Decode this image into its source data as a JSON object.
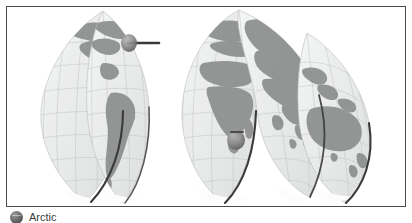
{
  "frame": {
    "border_color": "#4a4a4a",
    "background": "#ffffff"
  },
  "map": {
    "title": "Interrupted world map",
    "projection": "Goode homolosine interrupted globe gores",
    "style": "grayscale shaded relief with graticule",
    "land_color": "#8f9191",
    "ocean_color": "#e9eaea",
    "graticule_color": "#b9bcbc",
    "shadow_color": "#3a3a3a",
    "gores": [
      {
        "id": "gore-americas-north",
        "label": "North America lobe"
      },
      {
        "id": "gore-americas-south",
        "label": "South America lobe"
      },
      {
        "id": "gore-africa-europe",
        "label": "Europe and Africa lobe"
      },
      {
        "id": "gore-asia",
        "label": "Asia lobe"
      },
      {
        "id": "gore-oceania",
        "label": "Australia and Oceania lobe"
      }
    ],
    "landmasses": [
      "North America",
      "South America",
      "Greenland",
      "Europe",
      "Africa",
      "Madagascar",
      "Asia",
      "Southeast Asian archipelago",
      "Australia",
      "New Zealand",
      "Antarctica"
    ],
    "markers": [
      {
        "id": "marker-north",
        "label": "pointer marker",
        "x": 122,
        "y": 36
      },
      {
        "id": "marker-south-africa",
        "label": "pointer marker",
        "x": 229,
        "y": 133
      }
    ]
  },
  "caption": {
    "icon": "globe-icon",
    "text": "Arctic"
  }
}
